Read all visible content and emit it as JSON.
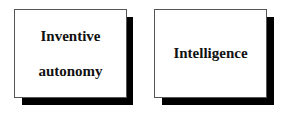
{
  "boxes": [
    {
      "lines": [
        "Inventive",
        "autonomy"
      ]
    },
    {
      "lines": [
        "Intelligence"
      ]
    }
  ]
}
